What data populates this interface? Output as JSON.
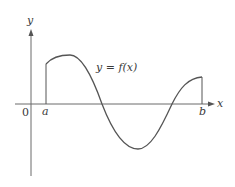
{
  "diagram": {
    "type": "function-graph",
    "axes": {
      "x_label": "x",
      "y_label": "y",
      "origin_label": "0"
    },
    "interval": {
      "left_label": "a",
      "right_label": "b"
    },
    "curve_label": "y = f(x)",
    "colors": {
      "stroke": "#555555",
      "text": "#3a3a3a",
      "background": "#ffffff"
    }
  }
}
